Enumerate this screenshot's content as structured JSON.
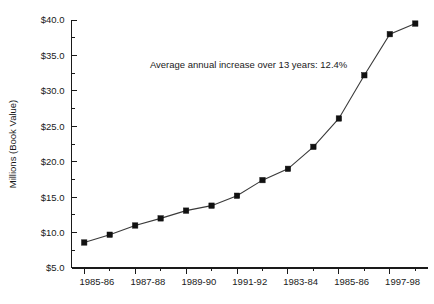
{
  "chart_data": {
    "type": "line",
    "title": "",
    "subtitle": "",
    "xlabel": "",
    "ylabel": "Millions (Book Value)",
    "ylim": [
      5.0,
      40.0
    ],
    "ytick_values": [
      5.0,
      10.0,
      15.0,
      20.0,
      25.0,
      30.0,
      35.0,
      40.0
    ],
    "ytick_labels": [
      "$5.0",
      "$10.0",
      "$15.0",
      "$20.0",
      "$25.0",
      "$30.0",
      "$35.0",
      "$40.0"
    ],
    "y_minor_ticks": true,
    "grid": false,
    "legend": null,
    "annotations": [
      {
        "text": "Average annual increase over 13 years: 12.4%",
        "x_frac": 0.22,
        "y_value": 33.2
      }
    ],
    "xtick_labels": [
      "1985-86",
      "1987-88",
      "1989-90",
      "1991-92",
      "1983-84",
      "1985-86",
      "1997-98"
    ],
    "xtick_label_indices": [
      0,
      2,
      4,
      6,
      8,
      10,
      12
    ],
    "categories": [
      "1985-86",
      "1986-87",
      "1987-88",
      "1988-89",
      "1989-90",
      "1990-91",
      "1991-92",
      "1992-93",
      "1983-84",
      "1994-95",
      "1985-86",
      "1996-97",
      "1997-98",
      "1998-99"
    ],
    "values": [
      8.6,
      9.7,
      11.0,
      12.0,
      13.1,
      13.8,
      15.2,
      17.4,
      19.0,
      22.1,
      26.1,
      32.2,
      38.0,
      39.5
    ],
    "series": [
      {
        "name": "Book Value",
        "values": [
          8.6,
          9.7,
          11.0,
          12.0,
          13.1,
          13.8,
          15.2,
          17.4,
          19.0,
          22.1,
          26.1,
          32.2,
          38.0,
          39.5
        ],
        "marker": "square",
        "marker_color": "#111111",
        "line_color": "#3a3a3a"
      }
    ]
  },
  "colors": {
    "background": "#ffffff",
    "axis": "#1a1a1a",
    "line": "#3a3a3a",
    "marker": "#111111",
    "text": "#1a1a1a"
  }
}
